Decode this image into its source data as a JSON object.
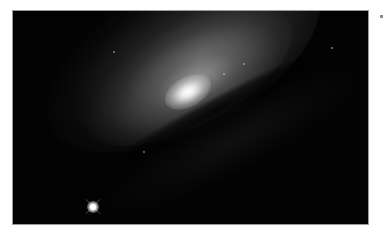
{
  "image": {
    "subject": "spiral galaxy with bright core and dust lane",
    "background_color": "#030303",
    "frame_border_color": "#9a9a9a",
    "page_background": "#ffffff",
    "features": [
      {
        "name": "galaxy-core",
        "x": 187,
        "y": 92
      },
      {
        "name": "foreground-star",
        "x": 94,
        "y": 206
      },
      {
        "name": "dust-lane",
        "angle_deg": -28
      }
    ]
  }
}
